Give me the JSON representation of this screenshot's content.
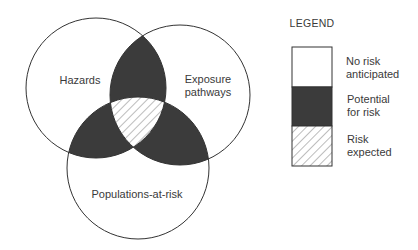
{
  "diagram": {
    "type": "venn",
    "sets": [
      {
        "id": "hazards",
        "label": "Hazards"
      },
      {
        "id": "exposure",
        "label_lines": [
          "Exposure",
          "pathways"
        ]
      },
      {
        "id": "populations",
        "label": "Populations-at-risk"
      }
    ],
    "regions": {
      "single": "no-risk",
      "pairwise": "potential-risk",
      "triple": "risk-expected"
    }
  },
  "legend": {
    "title": "LEGEND",
    "items": [
      {
        "id": "no-risk",
        "lines": [
          "No risk",
          "anticipated"
        ],
        "fill": "white"
      },
      {
        "id": "potential-risk",
        "lines": [
          "Potential",
          "for risk"
        ],
        "fill": "dark"
      },
      {
        "id": "risk-expected",
        "lines": [
          "Risk",
          "expected"
        ],
        "fill": "hatched"
      }
    ]
  },
  "colors": {
    "stroke": "#333333",
    "dark_fill": "#3b3b3b",
    "hatch": "#6a6a6a",
    "background": "#ffffff"
  }
}
